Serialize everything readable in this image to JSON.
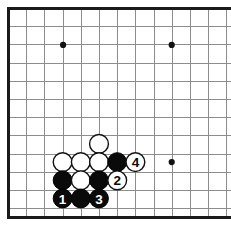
{
  "figure": {
    "name": "go-board-corner-diagram",
    "board_size": 19,
    "view": "bottom-left corner, cropped at right edge",
    "background_color": "#ffffff",
    "line_color": "#8d8d8d",
    "border_color": "#1a1a1a",
    "black_stone_color": "#0a0a0a",
    "white_stone_color": "#ffffff"
  },
  "geometry": {
    "origin_x": 8.5,
    "origin_y": 8.5,
    "spacing": 18.2,
    "columns": 13,
    "rows": 12,
    "stone_radius": 9.4,
    "left_edge_x": 8.5,
    "top_edge_y": 8.5,
    "bottom_edge_y": 217.0
  },
  "star_points": [
    {
      "name": "star-point-top-left",
      "x": 63.1,
      "y": 44.9
    },
    {
      "name": "star-point-top-right",
      "x": 171.7,
      "y": 44.9
    },
    {
      "name": "star-point-bottom-right",
      "x": 171.7,
      "y": 162.1
    }
  ],
  "stones": [
    {
      "name": "white-stone-a",
      "color": "white",
      "x": 99.0,
      "y": 143.9,
      "label": ""
    },
    {
      "name": "white-stone-b",
      "color": "white",
      "x": 62.6,
      "y": 162.1,
      "label": ""
    },
    {
      "name": "white-stone-c",
      "color": "white",
      "x": 80.8,
      "y": 162.1,
      "label": ""
    },
    {
      "name": "white-stone-d",
      "color": "white",
      "x": 99.0,
      "y": 162.1,
      "label": ""
    },
    {
      "name": "black-stone-e",
      "color": "black",
      "x": 117.2,
      "y": 162.1,
      "label": ""
    },
    {
      "name": "move-4-white",
      "color": "white",
      "x": 135.4,
      "y": 162.1,
      "label": "4"
    },
    {
      "name": "black-stone-f",
      "color": "black",
      "x": 62.6,
      "y": 180.3,
      "label": ""
    },
    {
      "name": "white-stone-g",
      "color": "white",
      "x": 80.8,
      "y": 180.3,
      "label": ""
    },
    {
      "name": "black-stone-h",
      "color": "black",
      "x": 99.0,
      "y": 180.3,
      "label": ""
    },
    {
      "name": "move-2-white",
      "color": "white",
      "x": 117.2,
      "y": 180.3,
      "label": "2"
    },
    {
      "name": "move-1-black",
      "color": "black",
      "x": 62.6,
      "y": 198.5,
      "label": "1"
    },
    {
      "name": "black-stone-i",
      "color": "black",
      "x": 80.8,
      "y": 198.5,
      "label": ""
    },
    {
      "name": "move-3-black",
      "color": "black",
      "x": 99.0,
      "y": 198.5,
      "label": "3"
    }
  ],
  "move_sequence": [
    {
      "number": "1",
      "color": "black"
    },
    {
      "number": "2",
      "color": "white"
    },
    {
      "number": "3",
      "color": "black"
    },
    {
      "number": "4",
      "color": "white"
    }
  ]
}
